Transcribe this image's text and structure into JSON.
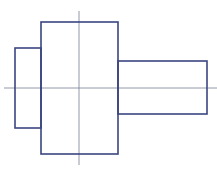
{
  "diagram": {
    "type": "technical-drawing",
    "subject": "stepped shaft front view",
    "title": "",
    "colors": {
      "outline": "#3a4580",
      "centerline": "#7a7f95",
      "background": "#ffffff"
    },
    "shapes": [
      {
        "id": "left-step",
        "kind": "rect",
        "x": 15,
        "y": 48,
        "width": 26,
        "height": 80
      },
      {
        "id": "main-body",
        "kind": "rect",
        "x": 41,
        "y": 22,
        "width": 77,
        "height": 132
      },
      {
        "id": "right-shaft",
        "kind": "rect",
        "x": 118,
        "y": 61,
        "width": 89,
        "height": 53
      }
    ],
    "centerlines": [
      {
        "id": "horizontal-axis",
        "x1": 4,
        "y1": 88,
        "x2": 217,
        "y2": 88
      },
      {
        "id": "vertical-axis",
        "x1": 79,
        "y1": 11,
        "x2": 79,
        "y2": 165
      }
    ]
  }
}
